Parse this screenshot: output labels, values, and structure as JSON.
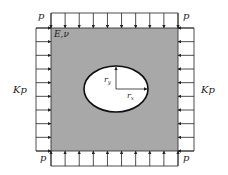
{
  "diagram": {
    "type": "plate-with-elliptical-hole-under-biaxial-load",
    "colors": {
      "plate_fill": "#a8a8a8",
      "hole_fill": "#ffffff",
      "line": "#222222",
      "background": "#ffffff"
    },
    "labels": {
      "material": "E,ν",
      "top_left_load": "p",
      "top_right_load": "p",
      "bottom_left_load": "p",
      "bottom_right_load": "p",
      "left_load": "Kp",
      "right_load": "Kp",
      "radius_y": "r",
      "radius_y_sub": "y",
      "radius_x": "r",
      "radius_x_sub": "x"
    },
    "arrows_per_side": 10,
    "plate": {
      "x": 51,
      "y": 28,
      "width": 127,
      "height": 123
    },
    "hole": {
      "cx": 116,
      "cy": 89,
      "rx": 32,
      "ry": 23
    }
  }
}
